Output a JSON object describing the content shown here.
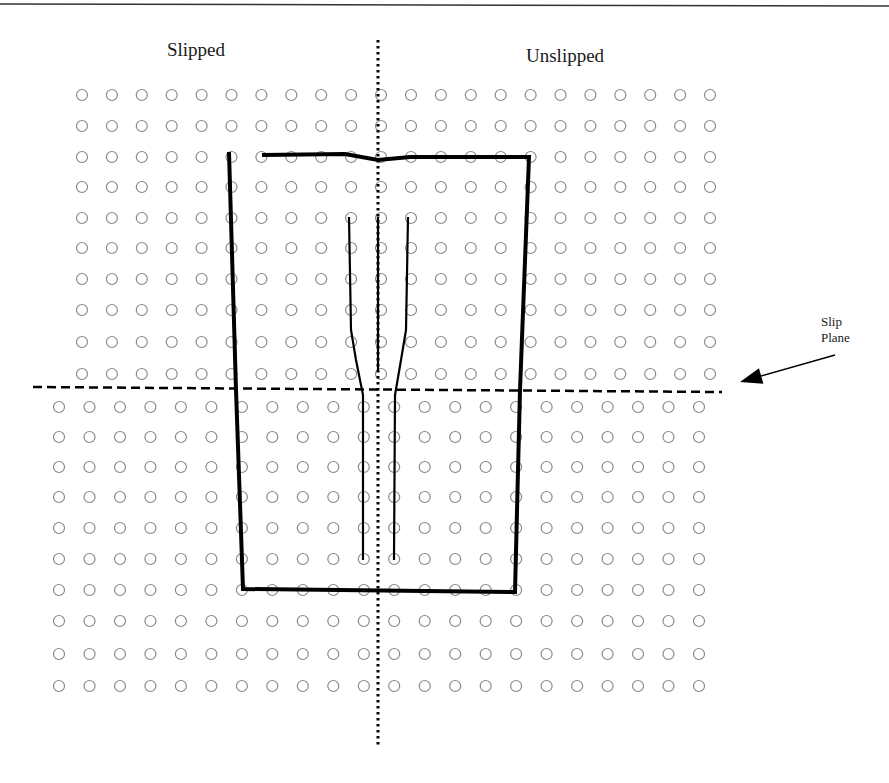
{
  "labels": {
    "slipped": "Slipped",
    "unslipped": "Unslipped",
    "slip_plane_line1": "Slip",
    "slip_plane_line2": "Plane"
  },
  "colors": {
    "atom_stroke": "#8a8a8a",
    "line": "#000000",
    "background": "#ffffff"
  },
  "lattice": {
    "top_block": {
      "columns": 22,
      "rows": [
        95,
        126,
        157,
        187,
        218,
        248,
        279,
        310,
        342,
        374
      ],
      "x_start": 82,
      "x_end": 710
    },
    "bottom_block": {
      "columns": 22,
      "rows": [
        407,
        437,
        467,
        497,
        528,
        559,
        590,
        621,
        654,
        686
      ],
      "x_start": 59,
      "x_end": 699
    },
    "atom_radius": 5.5
  },
  "slip_plane": {
    "x1": 33,
    "y1": 387,
    "x2": 722,
    "y2": 392
  },
  "center_axis": {
    "x": 378,
    "y1": 40,
    "y2": 748
  },
  "burgers_circuit": {
    "points": [
      [
        229,
        152
      ],
      [
        236,
        390
      ],
      [
        243,
        589
      ],
      [
        515,
        592
      ],
      [
        520,
        390
      ],
      [
        529,
        157
      ],
      [
        410,
        157
      ],
      [
        378,
        160
      ],
      [
        345,
        154
      ],
      [
        262,
        155
      ]
    ]
  },
  "extra_half_planes": [
    {
      "points": [
        [
          349,
          217
        ],
        [
          351,
          330
        ],
        [
          356,
          360
        ],
        [
          363,
          395
        ],
        [
          363,
          560
        ]
      ]
    },
    {
      "points": [
        [
          378,
          217
        ],
        [
          378,
          370
        ]
      ]
    },
    {
      "points": [
        [
          408,
          217
        ],
        [
          406,
          330
        ],
        [
          401,
          360
        ],
        [
          395,
          395
        ],
        [
          394,
          560
        ]
      ]
    }
  ],
  "arrow": {
    "from": [
      835,
      355
    ],
    "to": [
      740,
      382
    ]
  }
}
